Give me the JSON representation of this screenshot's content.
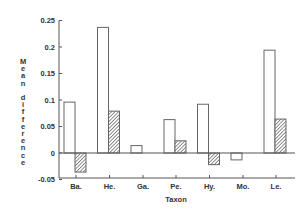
{
  "chart_data": {
    "type": "bar",
    "title": "",
    "xlabel": "Taxon",
    "ylabel": "Mean difference",
    "categories": [
      "Ba.",
      "He.",
      "Ga.",
      "Pe.",
      "Hy.",
      "Mo.",
      "Le."
    ],
    "series": [
      {
        "name": "open",
        "fill": "white",
        "values": [
          0.096,
          0.237,
          0.014,
          0.063,
          0.092,
          -0.013,
          0.194
        ]
      },
      {
        "name": "hatched",
        "fill": "hatched",
        "values": [
          -0.036,
          0.079,
          0.0,
          0.023,
          -0.022,
          0.0,
          0.064
        ]
      }
    ],
    "ylim": [
      -0.05,
      0.25
    ],
    "yticks": [
      "0.25",
      "0.2",
      "0.15",
      "0.1",
      "0.05",
      "0",
      "-0.05"
    ],
    "grid": false,
    "legend": "none"
  }
}
